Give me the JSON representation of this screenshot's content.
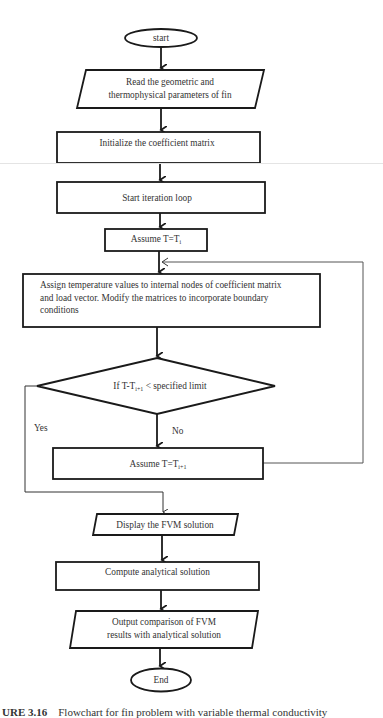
{
  "flowchart": {
    "nodes": {
      "start": {
        "type": "terminator",
        "label": "start"
      },
      "read_params": {
        "type": "input-output",
        "label_line1": "Read the geometric and",
        "label_line2": "thermophysical parameters of fin"
      },
      "init_matrix": {
        "type": "process",
        "label": "Initialize the coefficient matrix"
      },
      "start_loop": {
        "type": "process",
        "label": "Start iteration loop"
      },
      "assume_ti": {
        "type": "process",
        "label_prefix": "Assume T=T",
        "label_sub": "i"
      },
      "assign_temps": {
        "type": "process",
        "label_line1": "Assign temperature values to internal nodes of coefficient matrix",
        "label_line2": "and load vector. Modify the matrices to incorporate boundary",
        "label_line3": "conditions"
      },
      "decision": {
        "type": "decision",
        "label_prefix": "If T-T",
        "label_sub": "i+1",
        "label_suffix": " < specified limit"
      },
      "assume_ti1": {
        "type": "process",
        "label_prefix": "Assume T=T",
        "label_sub": "i+1"
      },
      "display_fvm": {
        "type": "input-output",
        "label": "Display the FVM solution"
      },
      "compute_analytical": {
        "type": "process",
        "label": "Compute analytical solution"
      },
      "output_comparison": {
        "type": "input-output",
        "label_line1": "Output comparison of FVM",
        "label_line2": "results with analytical solution"
      },
      "end": {
        "type": "terminator",
        "label": "End"
      }
    },
    "edge_labels": {
      "yes": "Yes",
      "no": "No"
    },
    "colors": {
      "stroke": "#1a1a1a",
      "loop_line": "#555555",
      "background": "#ffffff"
    }
  },
  "caption": {
    "figure_number": "URE 3.16",
    "text": "Flowchart for fin problem with variable thermal conductivity"
  }
}
